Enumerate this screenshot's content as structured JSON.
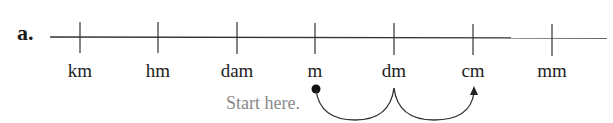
{
  "problem_label": "a.",
  "units": [
    {
      "label": "km",
      "x": 80
    },
    {
      "label": "hm",
      "x": 158
    },
    {
      "label": "dam",
      "x": 237
    },
    {
      "label": "m",
      "x": 315
    },
    {
      "label": "dm",
      "x": 394
    },
    {
      "label": "cm",
      "x": 473
    },
    {
      "label": "mm",
      "x": 552
    }
  ],
  "start_text": "Start here.",
  "start_unit": "m",
  "end_unit": "cm",
  "colors": {
    "line": "#333333",
    "start_text": "#8a8a8a"
  }
}
